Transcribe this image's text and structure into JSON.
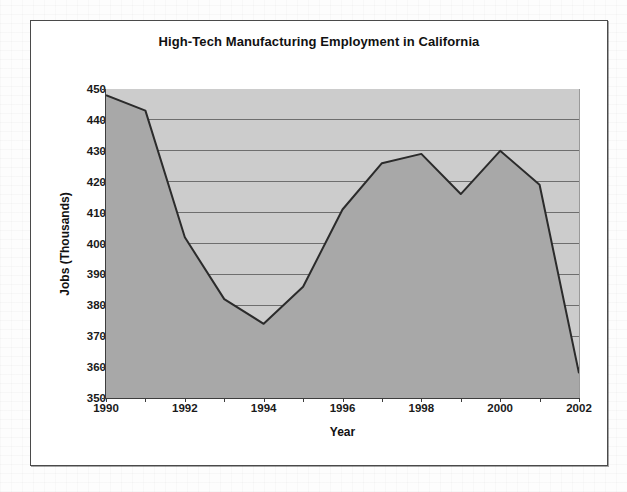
{
  "figure": {
    "title": "High-Tech Manufacturing Employment in California",
    "x_axis_title": "Year",
    "y_axis_title": "Jobs (Thousands)"
  },
  "colors": {
    "plot_background": "#cccccc",
    "area_fill": "#a8a8a8",
    "line": "#2b2b2b",
    "gridline": "#6e6e6e",
    "axis": "#3d3d3d",
    "text": "#111111",
    "frame": "#4a4a4a",
    "page_background": "#fdfdfd"
  },
  "chart_data": {
    "type": "area",
    "title": "High-Tech Manufacturing Employment in California",
    "xlabel": "Year",
    "ylabel": "Jobs (Thousands)",
    "x": [
      1990,
      1991,
      1992,
      1993,
      1994,
      1995,
      1996,
      1997,
      1998,
      1999,
      2000,
      2001,
      2002
    ],
    "values": [
      448,
      443,
      402,
      382,
      374,
      386,
      411,
      426,
      429,
      416,
      430,
      419,
      358
    ],
    "xlim": [
      1990,
      2002
    ],
    "ylim": [
      350,
      450
    ],
    "ytick_labels": [
      "450",
      "440",
      "430",
      "420",
      "410",
      "400",
      "390",
      "380",
      "370",
      "360",
      "350"
    ],
    "ytick_values": [
      450,
      440,
      430,
      420,
      410,
      400,
      390,
      380,
      370,
      360,
      350
    ],
    "xtick_labels": [
      "1990",
      "1992",
      "1994",
      "1996",
      "1998",
      "2000",
      "2002"
    ],
    "xtick_values": [
      1990,
      1992,
      1994,
      1996,
      1998,
      2000,
      2002
    ],
    "grid": "horizontal",
    "legend": "none"
  }
}
